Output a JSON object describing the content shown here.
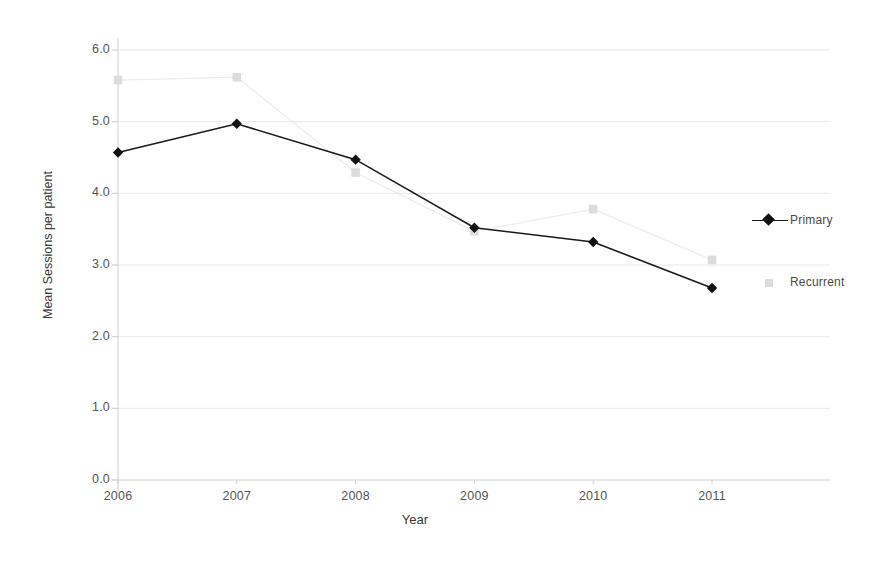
{
  "chart_data": {
    "type": "line",
    "title": "",
    "xlabel": "Year",
    "ylabel": "Mean Sessions per patient",
    "categories": [
      "2006",
      "2007",
      "2008",
      "2009",
      "2010",
      "2011"
    ],
    "x": [
      2006,
      2007,
      2008,
      2009,
      2010,
      2011
    ],
    "ylim": [
      0.0,
      6.0
    ],
    "y_ticks": [
      "0.0",
      "1.0",
      "2.0",
      "3.0",
      "4.0",
      "5.0",
      "6.0"
    ],
    "y_tick_values": [
      0.0,
      1.0,
      2.0,
      3.0,
      4.0,
      5.0,
      6.0
    ],
    "grid": true,
    "grid_axis": "y",
    "legend_position": "right",
    "series": [
      {
        "name": "Primary",
        "marker": "diamond",
        "color": "#111111",
        "line_color": "#1a1a1a",
        "values": [
          4.57,
          4.97,
          4.47,
          3.52,
          3.32,
          2.68
        ]
      },
      {
        "name": "Recurrent",
        "marker": "square",
        "color": "#dcdcdc",
        "line_color": "#ececec",
        "values": [
          5.58,
          5.62,
          4.29,
          3.47,
          3.78,
          3.07
        ]
      }
    ]
  },
  "axes": {
    "x_label": "Year",
    "y_label": "Mean Sessions per patient"
  },
  "legend": {
    "items": [
      {
        "label": "Primary",
        "marker": "diamond-marker",
        "color": "#111111"
      },
      {
        "label": "Recurrent",
        "marker": "square-marker",
        "color": "#dcdcdc"
      }
    ]
  },
  "colors": {
    "primary_series": "#111111",
    "recurrent_series": "#dcdcdc",
    "gridline": "#e8e8e8",
    "axis": "#d0d0d0",
    "text": "#555555"
  }
}
